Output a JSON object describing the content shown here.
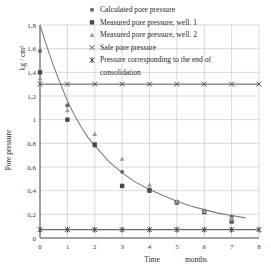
{
  "chart_data": {
    "type": "scatter",
    "title": "",
    "xlabel": "Time",
    "xunit": "months",
    "ylabel": "Pore pressure",
    "yunit": "kg / cm²",
    "xlim": [
      0,
      8
    ],
    "ylim": [
      0,
      1.8
    ],
    "xticks": [
      "0",
      "1",
      "2",
      "3",
      "4",
      "5",
      "6",
      "7",
      "8"
    ],
    "yticks": [
      "0",
      "0,2",
      "0,4",
      "0,6",
      "0,8",
      "1",
      "1,2",
      "1,4",
      "1,6",
      "1,8"
    ],
    "grid": true,
    "legend_position": "top-right",
    "series": [
      {
        "name": "Calculated pore pressure",
        "marker": "circle",
        "color": "#6b6b6b",
        "x": [
          0,
          1,
          2,
          3,
          4,
          5,
          6,
          7
        ],
        "y": [
          1.58,
          1.12,
          0.78,
          0.56,
          0.41,
          0.3,
          0.23,
          0.18
        ]
      },
      {
        "name": "Measured pore pressure, well. 1",
        "marker": "square",
        "color": "#4a4a4a",
        "x": [
          0,
          1,
          2,
          3,
          4,
          5,
          6,
          7
        ],
        "y": [
          1.4,
          1.0,
          0.79,
          0.44,
          0.4,
          0.3,
          0.22,
          0.14
        ]
      },
      {
        "name": "Measured pore pressure, well. 2",
        "marker": "triangle",
        "color": "#9a9a9a",
        "x": [
          0,
          1,
          2,
          3,
          4,
          5,
          6,
          7
        ],
        "y": [
          1.35,
          1.08,
          0.88,
          0.67,
          0.45,
          0.31,
          0.23,
          0.16
        ]
      },
      {
        "name": "Safe pore pressure",
        "marker": "cross",
        "color": "#555555",
        "constant_line": 1.3,
        "x": [
          0,
          1,
          2,
          3,
          4,
          5,
          6,
          7,
          8
        ],
        "y": [
          1.3,
          1.3,
          1.3,
          1.3,
          1.3,
          1.3,
          1.3,
          1.3,
          1.3
        ]
      },
      {
        "name": "Pressure corresponding to the end of consolidation",
        "marker": "star",
        "color": "#444444",
        "constant_line": 0.07,
        "x": [
          0,
          1,
          2,
          3,
          4,
          5,
          6,
          7,
          8
        ],
        "y": [
          0.07,
          0.07,
          0.07,
          0.07,
          0.07,
          0.07,
          0.07,
          0.07,
          0.07
        ]
      }
    ],
    "fit_curve": {
      "name": "calculated-decay-curve",
      "color": "#7d7d7d",
      "x": [
        0,
        0.25,
        0.5,
        0.75,
        1,
        1.25,
        1.5,
        1.75,
        2,
        2.5,
        3,
        3.5,
        4,
        4.5,
        5,
        5.5,
        6,
        6.5,
        7,
        7.5
      ],
      "y": [
        1.8,
        1.62,
        1.45,
        1.3,
        1.16,
        1.04,
        0.94,
        0.85,
        0.78,
        0.65,
        0.55,
        0.47,
        0.41,
        0.36,
        0.31,
        0.27,
        0.24,
        0.21,
        0.19,
        0.17
      ]
    },
    "legend": [
      {
        "label": "Calculated pore pressure",
        "marker": "circle",
        "color": "#6b6b6b"
      },
      {
        "label": "Measured pore pressure, well. 1",
        "marker": "square",
        "color": "#4a4a4a"
      },
      {
        "label": "Measured pore pressure, well. 2",
        "marker": "triangle",
        "color": "#9a9a9a"
      },
      {
        "label": "Safe pore pressure",
        "marker": "cross",
        "color": "#555555"
      },
      {
        "label": "Pressure corresponding to the end of",
        "marker": "star",
        "color": "#444444"
      },
      {
        "label": "consolidation",
        "marker": "none",
        "color": "#444444"
      }
    ]
  }
}
